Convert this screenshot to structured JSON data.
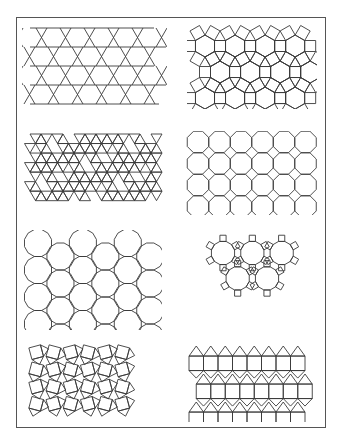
{
  "figure": {
    "title": "",
    "stroke_color": "#3a3a3a",
    "frame_color": "#555555",
    "panels": [
      {
        "id": "p1",
        "name": "trihexagonal-tiling",
        "vertex_config": "3.6.3.6"
      },
      {
        "id": "p2",
        "name": "rhombitrihexagonal-tiling",
        "vertex_config": "3.4.6.4"
      },
      {
        "id": "p3",
        "name": "snub-hexagonal-tiling",
        "vertex_config": "3.3.3.3.6"
      },
      {
        "id": "p4",
        "name": "truncated-square-tiling",
        "vertex_config": "4.8.8"
      },
      {
        "id": "p5",
        "name": "truncated-hexagonal-tiling",
        "vertex_config": "3.12.12"
      },
      {
        "id": "p6",
        "name": "truncated-trihexagonal-tiling",
        "vertex_config": "4.6.12"
      },
      {
        "id": "p7",
        "name": "snub-square-tiling",
        "vertex_config": "3.3.4.3.4"
      },
      {
        "id": "p8",
        "name": "elongated-triangular-tiling",
        "vertex_config": "3.3.3.4.4"
      }
    ]
  }
}
